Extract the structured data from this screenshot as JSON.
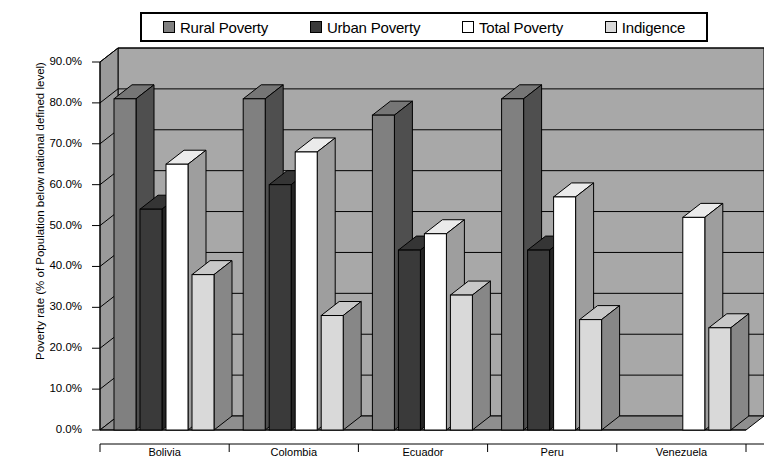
{
  "chart_data": {
    "type": "bar",
    "title": "",
    "subtitle": "",
    "xlabel": "",
    "ylabel": "Poverty rate (% of Population below national defined level)",
    "categories": [
      "Bolivia",
      "Colombia",
      "Ecuador",
      "Peru",
      "Venezuela"
    ],
    "series": [
      {
        "name": "Rural Poverty",
        "color": "#808080",
        "values": [
          81.0,
          81.0,
          77.0,
          81.0,
          null
        ]
      },
      {
        "name": "Urban Poverty",
        "color": "#3a3a3a",
        "values": [
          54.0,
          60.0,
          44.0,
          44.0,
          null
        ]
      },
      {
        "name": "Total Poverty",
        "color": "#ffffff",
        "values": [
          65.0,
          68.0,
          48.0,
          57.0,
          52.0
        ]
      },
      {
        "name": "Indigence",
        "color": "#d9d9d9",
        "values": [
          38.0,
          28.0,
          33.0,
          27.0,
          25.0
        ]
      }
    ],
    "ylim": [
      0,
      90
    ],
    "ytick_values": [
      0,
      10,
      20,
      30,
      40,
      50,
      60,
      70,
      80,
      90
    ],
    "ytick_labels": [
      "0.0%",
      "10.0%",
      "20.0%",
      "30.0%",
      "40.0%",
      "50.0%",
      "60.0%",
      "70.0%",
      "80.0%",
      "90.0%"
    ],
    "grid": true,
    "grid_axis": "y",
    "legend_position": "top",
    "style": "3d-bar",
    "plot_background": "#a8a8a8",
    "bar_outline": "#000000"
  },
  "legend": {
    "items": [
      {
        "label": "Rural Poverty",
        "swatch_color": "#808080"
      },
      {
        "label": "Urban Poverty",
        "swatch_color": "#3a3a3a"
      },
      {
        "label": "Total Poverty",
        "swatch_color": "#ffffff"
      },
      {
        "label": "Indigence",
        "swatch_color": "#d9d9d9"
      }
    ]
  },
  "axes": {
    "y_title": "Poverty rate (% of Population below national defined level)",
    "y_labels": [
      "90.0%",
      "80.0%",
      "70.0%",
      "60.0%",
      "50.0%",
      "40.0%",
      "30.0%",
      "20.0%",
      "10.0%",
      "0.0%"
    ],
    "x_labels": [
      "Bolivia",
      "Colombia",
      "Ecuador",
      "Peru",
      "Venezuela"
    ]
  }
}
